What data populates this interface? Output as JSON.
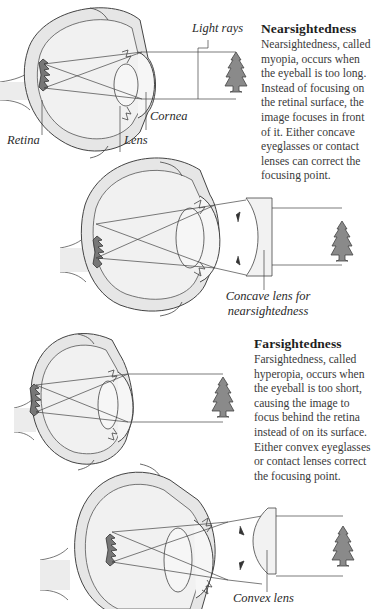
{
  "nearsightedness": {
    "heading": "Nearsightedness",
    "body": "Nearsightedness, called myopia, occurs when the eyeball is too long. Instead of focusing on the retinal surface, the image focuses in front of it. Either concave eyeglasses or contact lenses can correct the focusing point.",
    "labels": {
      "light_rays": "Light rays",
      "cornea": "Cornea",
      "retina": "Retina",
      "lens": "Lens"
    },
    "correction_label_line1": "Concave lens for",
    "correction_label_line2": "nearsightedness"
  },
  "farsightedness": {
    "heading": "Farsightedness",
    "body": "Farsightedness, called hyperopia, occurs when the eyeball is too short, causing the image to focus behind the retina instead of on its surface. Either convex eyeglasses or contact lenses correct the focusing point.",
    "correction_label": "Convex lens"
  },
  "colors": {
    "eye_fill": "#ececec",
    "outline": "#4a4a4a",
    "tree_fill": "#8a8a8a",
    "lens_fill": "#f2f2f2"
  }
}
